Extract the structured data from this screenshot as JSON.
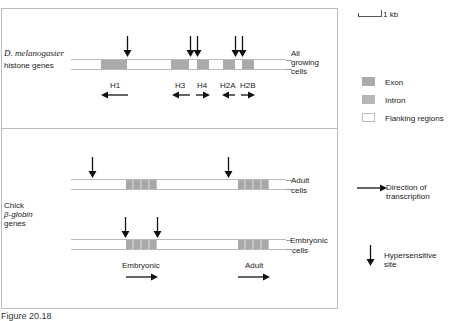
{
  "scale_bar": {
    "label": "1 kb"
  },
  "panel_histone": {
    "organism": "D. melanogaster",
    "label_line2": "histone genes",
    "condition": [
      "All",
      "growing",
      "cells"
    ],
    "genes": [
      {
        "name": "H1",
        "direction": "left"
      },
      {
        "name": "H3",
        "direction": "left"
      },
      {
        "name": "H4",
        "direction": "right"
      },
      {
        "name": "H2A",
        "direction": "left"
      },
      {
        "name": "H2B",
        "direction": "right"
      }
    ]
  },
  "panel_globin": {
    "label": [
      "Chick",
      "β-globin",
      "genes"
    ],
    "rows": [
      {
        "condition": [
          "Adult",
          "cells"
        ]
      },
      {
        "condition": [
          "Embryonic",
          "cells"
        ]
      }
    ],
    "genes": [
      {
        "name": "Embryonic",
        "direction": "right"
      },
      {
        "name": "Adult",
        "direction": "right"
      }
    ]
  },
  "legend": {
    "exon": "Exon",
    "intron": "Intron",
    "flanking": "Flanking regions",
    "direction": [
      "Direction of",
      "transcription"
    ],
    "hypersensitive": [
      "Hypersensitive",
      "site"
    ]
  },
  "caption": "Figure 20.18",
  "colors": {
    "exon": "#aaaaaa",
    "intron": "#b4b4b4",
    "frame": "#bdbdbd"
  }
}
